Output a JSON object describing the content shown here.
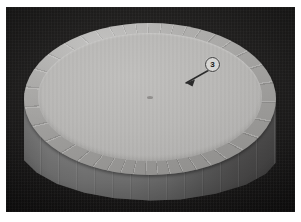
{
  "figure": {
    "frame_color": "#ffffff",
    "background_color": "#191818",
    "scene_description": "Faceted cylindrical vessel photographed from an elevated angle against a dark background"
  },
  "subject": {
    "rim": {
      "name": "faceted-rim-band",
      "color": "#a0a09e",
      "facet_count": 40
    },
    "inner_disc": {
      "name": "inner-flat-disc",
      "color": "#b4b3b1"
    },
    "body": {
      "name": "cylinder-wall",
      "color": "#787878",
      "shadow_color": "#474646"
    },
    "center_mark": {
      "name": "center-dot",
      "color": "#6e6c6a"
    }
  },
  "annotations": [
    {
      "id": "callout-3",
      "label": "3",
      "badge_color": "#d6d5d3",
      "badge_border_color": "#3a3a3a",
      "text_color": "#151515",
      "arrow_color": "#2b2b2b",
      "points_to": "rim-edge-upper-right"
    }
  ]
}
